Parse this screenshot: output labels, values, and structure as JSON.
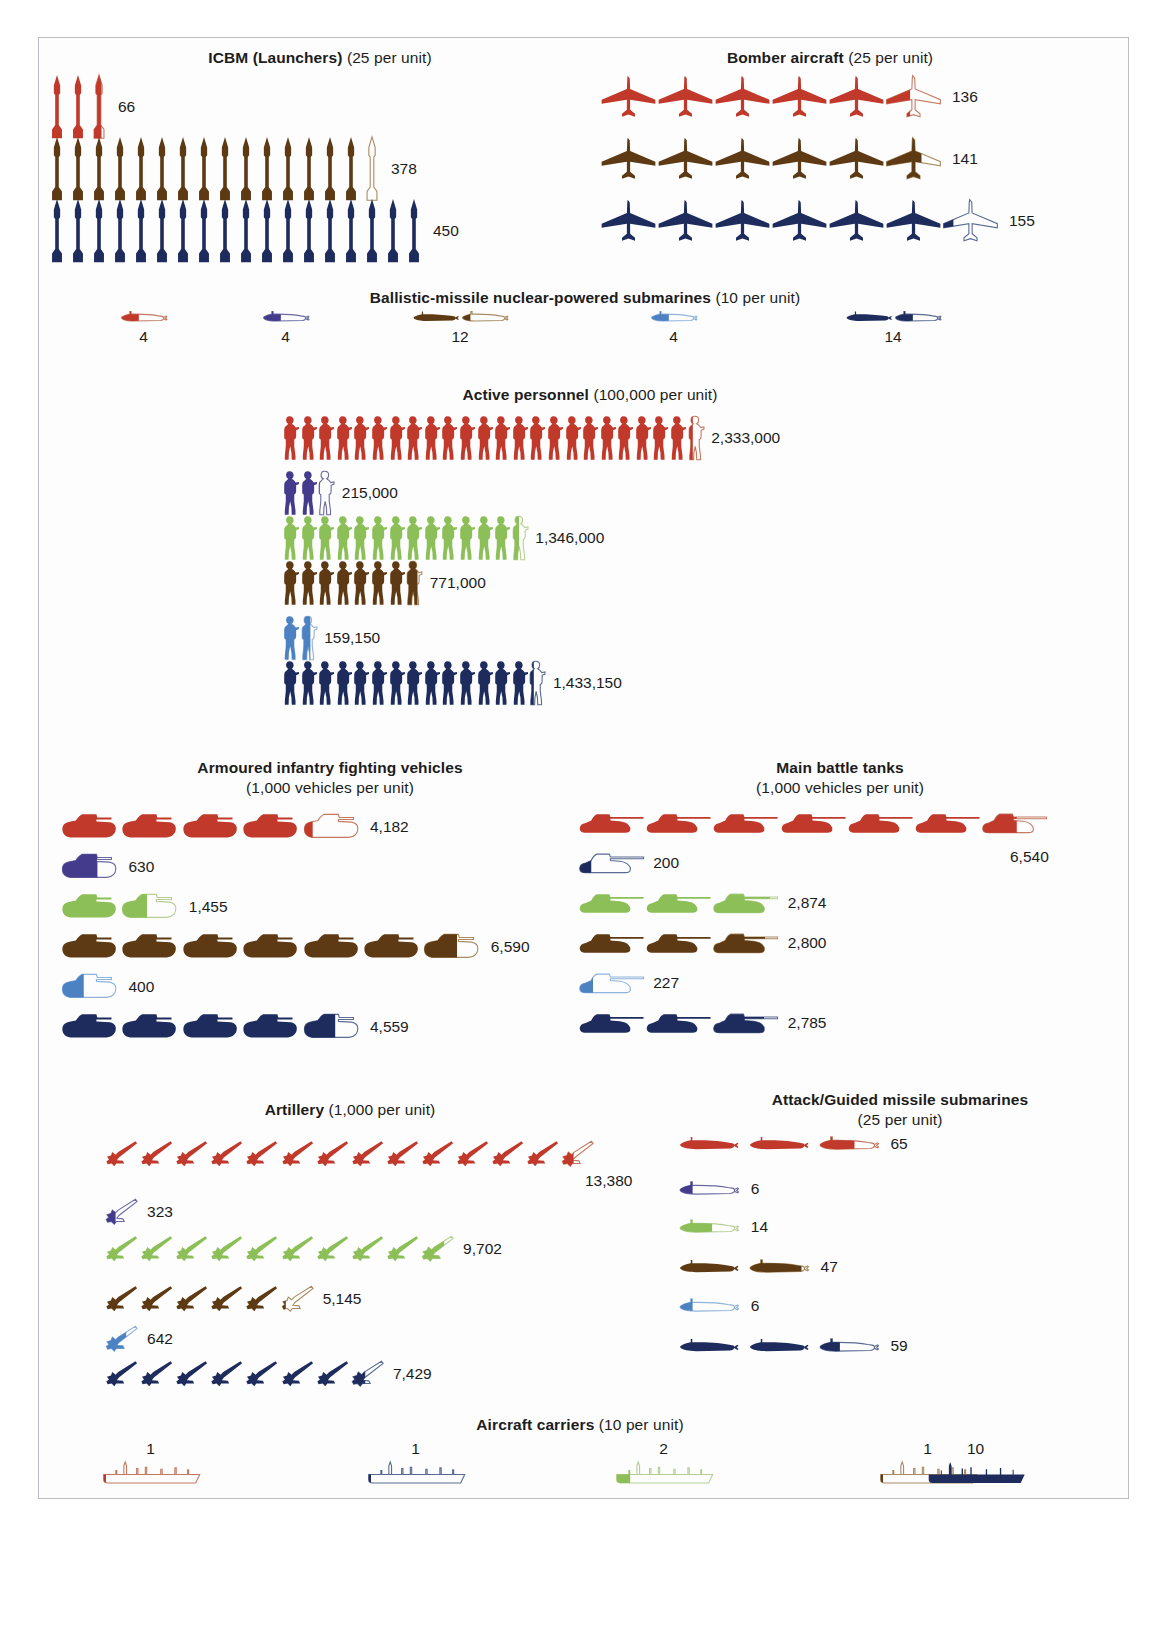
{
  "colors": {
    "red": "#c0392b",
    "purple": "#443b8c",
    "green": "#8cbf57",
    "brown": "#5d3a13",
    "lightblue": "#4d82c2",
    "navy": "#1d2c5c",
    "outline_red": "#c47a62",
    "outline_purple": "#6b6aa0",
    "outline_green": "#b7cf96",
    "outline_brown": "#a98c63",
    "outline_lightblue": "#8fb3da",
    "outline_navy": "#5a6a92",
    "text": "#1b1b1b",
    "frame": "#b9bcc0"
  },
  "chart_data": {
    "type": "pictogram",
    "countries": [
      "red",
      "purple",
      "green",
      "brown",
      "lightblue",
      "navy"
    ],
    "sections": [
      {
        "id": "icbm",
        "name": "ICBM (Launchers)",
        "unit_note": "(25 per unit)",
        "unit_value": 25,
        "icon": "missile",
        "rows": [
          {
            "color": "red",
            "value": 66,
            "label": "66",
            "full": 2,
            "partial": 0.64
          },
          {
            "color": "brown",
            "value": 378,
            "label": "378",
            "full": 15,
            "partial": 0.12
          },
          {
            "color": "navy",
            "value": 450,
            "label": "450",
            "full": 18,
            "partial": 0
          }
        ]
      },
      {
        "id": "bomber",
        "name": "Bomber aircraft",
        "unit_note": "(25 per unit)",
        "unit_value": 25,
        "icon": "bomber",
        "rows": [
          {
            "color": "red",
            "value": 136,
            "label": "136",
            "full": 5,
            "partial": 0.44
          },
          {
            "color": "brown",
            "value": 141,
            "label": "141",
            "full": 5,
            "partial": 0.64
          },
          {
            "color": "navy",
            "value": 155,
            "label": "155",
            "full": 6,
            "partial": 0.2
          }
        ]
      },
      {
        "id": "ssbn",
        "name": "Ballistic-missile nuclear-powered submarines",
        "unit_note": "(10 per unit)",
        "unit_value": 10,
        "icon": "submarine",
        "layout": "inline",
        "rows": [
          {
            "color": "red",
            "value": 4,
            "label": "4",
            "full": 0,
            "partial": 0.4
          },
          {
            "color": "purple",
            "value": 4,
            "label": "4",
            "full": 0,
            "partial": 0.4
          },
          {
            "color": "brown",
            "value": 12,
            "label": "12",
            "full": 1,
            "partial": 0.2
          },
          {
            "color": "lightblue",
            "value": 4,
            "label": "4",
            "full": 0,
            "partial": 0.4
          },
          {
            "color": "navy",
            "value": 14,
            "label": "14",
            "full": 1,
            "partial": 0.4
          }
        ]
      },
      {
        "id": "personnel",
        "name": "Active personnel",
        "unit_note": "(100,000 per unit)",
        "unit_value": 100000,
        "icon": "soldier",
        "rows": [
          {
            "color": "red",
            "value": 2333000,
            "label": "2,333,000",
            "full": 23,
            "partial": 0.33
          },
          {
            "color": "purple",
            "value": 215000,
            "label": "215,000",
            "full": 2,
            "partial": 0.15
          },
          {
            "color": "green",
            "value": 1346000,
            "label": "1,346,000",
            "full": 13,
            "partial": 0.46
          },
          {
            "color": "brown",
            "value": 771000,
            "label": "771,000",
            "full": 7,
            "partial": 0.71
          },
          {
            "color": "lightblue",
            "value": 159150,
            "label": "159,150",
            "full": 1,
            "partial": 0.59
          },
          {
            "color": "navy",
            "value": 1433150,
            "label": "1,433,150",
            "full": 14,
            "partial": 0.33
          }
        ]
      },
      {
        "id": "aifv",
        "name": "Armoured infantry fighting vehicles",
        "unit_note": "(1,000 vehicles per unit)",
        "unit_value": 1000,
        "icon": "ifv",
        "rows": [
          {
            "color": "red",
            "value": 4182,
            "label": "4,182",
            "full": 4,
            "partial": 0.18
          },
          {
            "color": "purple",
            "value": 630,
            "label": "630",
            "full": 0,
            "partial": 0.63
          },
          {
            "color": "green",
            "value": 1455,
            "label": "1,455",
            "full": 1,
            "partial": 0.455
          },
          {
            "color": "brown",
            "value": 6590,
            "label": "6,590",
            "full": 6,
            "partial": 0.59
          },
          {
            "color": "lightblue",
            "value": 400,
            "label": "400",
            "full": 0,
            "partial": 0.4
          },
          {
            "color": "navy",
            "value": 4559,
            "label": "4,559",
            "full": 4,
            "partial": 0.559
          }
        ]
      },
      {
        "id": "mbt",
        "name": "Main battle tanks",
        "unit_note": "(1,000 vehicles per unit)",
        "unit_value": 1000,
        "icon": "tank",
        "rows": [
          {
            "color": "red",
            "value": 6540,
            "label": "6,540",
            "full": 6,
            "partial": 0.54,
            "label_below": true
          },
          {
            "color": "navy",
            "value": 200,
            "label": "200",
            "full": 0,
            "partial": 0.2
          },
          {
            "color": "green",
            "value": 2874,
            "label": "2,874",
            "full": 2,
            "partial": 0.874
          },
          {
            "color": "brown",
            "value": 2800,
            "label": "2,800",
            "full": 2,
            "partial": 0.8
          },
          {
            "color": "lightblue",
            "value": 227,
            "label": "227",
            "full": 0,
            "partial": 0.227
          },
          {
            "color": "navy",
            "value": 2785,
            "label": "2,785",
            "full": 2,
            "partial": 0.785
          }
        ]
      },
      {
        "id": "artillery",
        "name": "Artillery",
        "unit_note": "(1,000 per unit)",
        "unit_value": 1000,
        "icon": "howitzer",
        "rows": [
          {
            "color": "red",
            "value": 13380,
            "label": "13,380",
            "full": 13,
            "partial": 0.38,
            "label_below": true
          },
          {
            "color": "purple",
            "value": 323,
            "label": "323",
            "full": 0,
            "partial": 0.32
          },
          {
            "color": "green",
            "value": 9702,
            "label": "9,702",
            "full": 9,
            "partial": 0.7
          },
          {
            "color": "brown",
            "value": 5145,
            "label": "5,145",
            "full": 5,
            "partial": 0.145
          },
          {
            "color": "lightblue",
            "value": 642,
            "label": "642",
            "full": 0,
            "partial": 0.64
          },
          {
            "color": "navy",
            "value": 7429,
            "label": "7,429",
            "full": 7,
            "partial": 0.43
          }
        ]
      },
      {
        "id": "ssn",
        "name": "Attack/Guided missile submarines",
        "unit_note": "(25 per unit)",
        "unit_value": 25,
        "icon": "submarine",
        "rows": [
          {
            "color": "red",
            "value": 65,
            "label": "65",
            "full": 2,
            "partial": 0.6
          },
          {
            "color": "purple",
            "value": 6,
            "label": "6",
            "full": 0,
            "partial": 0.24
          },
          {
            "color": "green",
            "value": 14,
            "label": "14",
            "full": 0,
            "partial": 0.56
          },
          {
            "color": "brown",
            "value": 47,
            "label": "47",
            "full": 1,
            "partial": 0.88
          },
          {
            "color": "lightblue",
            "value": 6,
            "label": "6",
            "full": 0,
            "partial": 0.24
          },
          {
            "color": "navy",
            "value": 59,
            "label": "59",
            "full": 2,
            "partial": 0.36
          }
        ]
      },
      {
        "id": "carriers",
        "name": "Aircraft carriers",
        "unit_note": "(10 per unit)",
        "unit_value": 10,
        "icon": "carrier",
        "layout": "inline",
        "rows": [
          {
            "color": "red",
            "value": 1,
            "label": "1",
            "full": 0,
            "partial": 0.1
          },
          {
            "color": "navy",
            "value": 1,
            "label": "1",
            "full": 0,
            "partial": 0.1
          },
          {
            "color": "green",
            "value": 2,
            "label": "2",
            "full": 0,
            "partial": 0.2
          },
          {
            "color": "brown",
            "value": 1,
            "label": "1",
            "full": 0,
            "partial": 0.1
          },
          {
            "color": "navy",
            "value": 10,
            "label": "10",
            "full": 1,
            "partial": 0
          }
        ]
      }
    ]
  }
}
